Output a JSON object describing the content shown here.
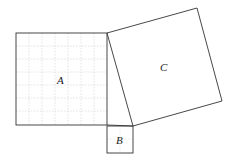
{
  "diagram": {
    "type": "pythagorean-squares",
    "colors": {
      "stroke": "#333333",
      "grid": "#bfbfbf",
      "background": "#ffffff"
    },
    "squares": [
      {
        "id": "A",
        "label": "A",
        "grid_divisions": 7
      },
      {
        "id": "B",
        "label": "B",
        "grid_divisions": 0
      },
      {
        "id": "C",
        "label": "C",
        "grid_divisions": 0
      }
    ]
  }
}
